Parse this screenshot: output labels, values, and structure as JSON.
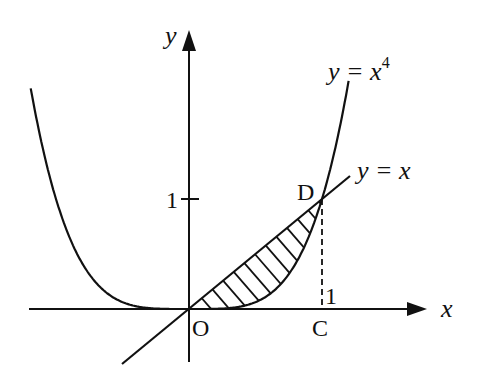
{
  "diagram": {
    "type": "function-graph",
    "axes": {
      "x_label": "x",
      "y_label": "y",
      "origin_label": "O",
      "x_tick_label": "1",
      "y_tick_label": "1"
    },
    "curves": [
      {
        "label_base": "y = x",
        "label_sup": "4",
        "kind": "quartic",
        "full_label": "y = x^4"
      },
      {
        "label": "y = x",
        "kind": "line"
      }
    ],
    "points": [
      {
        "name": "D",
        "label": "D",
        "coords": [
          1,
          1
        ]
      },
      {
        "name": "C",
        "label": "C",
        "coords": [
          1,
          0
        ]
      },
      {
        "name": "O",
        "label": "O",
        "coords": [
          0,
          0
        ]
      }
    ],
    "shaded_region": {
      "description": "Region between y = x and y = x^4 from x = 0 to x = 1",
      "style": "hatched"
    },
    "colors": {
      "stroke": "#111111",
      "background": "#ffffff"
    }
  }
}
